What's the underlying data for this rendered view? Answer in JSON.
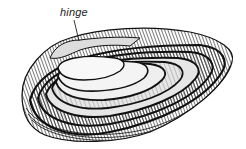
{
  "figure": {
    "annotations": [
      {
        "label": "hinge"
      }
    ],
    "colors": {
      "background": "#ffffff",
      "ink": "#1a1a1a"
    }
  }
}
